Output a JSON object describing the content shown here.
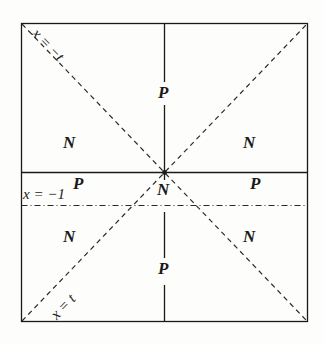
{
  "figure": {
    "type": "spacetime-diagram",
    "background_color": "#fdfdfc",
    "line_color": "#1a1a1a",
    "frame": {
      "x": 21,
      "y": 23,
      "width": 287,
      "height": 299
    },
    "lines": {
      "diagonal_down": {
        "style": "dashed",
        "label": "x = -t"
      },
      "diagonal_up": {
        "style": "dashed",
        "label": "x = t"
      },
      "vertical_center": {
        "style": "solid-broken",
        "x": 164
      },
      "horizontal_solid": {
        "style": "solid",
        "y": 172
      },
      "horizontal_dashdot": {
        "style": "dash-dot",
        "y": 205,
        "label": "x = -1"
      }
    },
    "labels": {
      "diag_top_left": "x = −t",
      "diag_bottom_left": "x = t",
      "axis_x_minus_1": "x = −1",
      "top_center_P": "P",
      "bottom_center_P": "P",
      "center_N": "N",
      "mid_left_P": "P",
      "mid_right_P": "P",
      "upper_left_N": "N",
      "upper_right_N": "N",
      "lower_left_N": "N",
      "lower_right_N": "N"
    }
  }
}
